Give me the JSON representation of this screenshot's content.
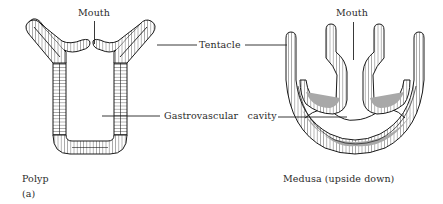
{
  "figure": {
    "panel_label": "(a)",
    "polyp": {
      "caption": "Polyp",
      "mouth_label": "Mouth"
    },
    "medusa": {
      "caption": "Medusa (upside down)",
      "mouth_label": "Mouth"
    },
    "shared_labels": {
      "tentacle": "Tentacle",
      "gastrovascular_cavity": "Gastrovascular   cavity"
    }
  }
}
